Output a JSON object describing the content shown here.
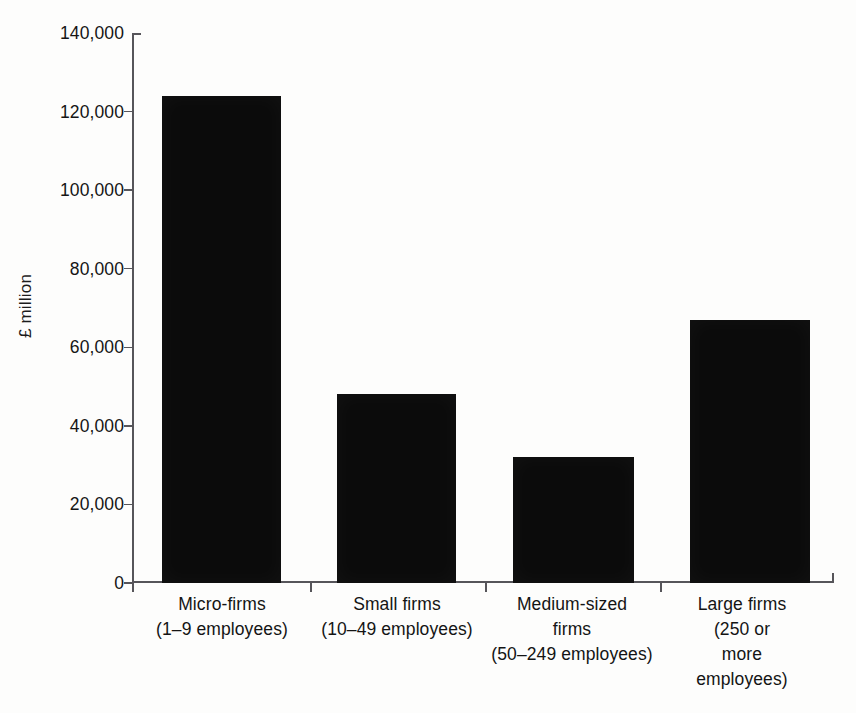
{
  "chart_data": {
    "type": "bar",
    "title": "",
    "xlabel": "",
    "ylabel": "£ million",
    "categories": [
      "Micro-firms (1–9 employees)",
      "Small firms (10–49 employees)",
      "Medium-sized firms (50–249 employees)",
      "Large firms (250 or more employees)"
    ],
    "category_lines": [
      [
        "Micro-firms",
        "(1–9 employees)"
      ],
      [
        "Small firms",
        "(10–49 employees)"
      ],
      [
        "Medium-sized",
        "firms",
        "(50–249 employees)"
      ],
      [
        "Large firms",
        "(250 or",
        "more",
        "employees)"
      ]
    ],
    "values": [
      124000,
      48000,
      32000,
      67000
    ],
    "ylim": [
      0,
      140000
    ],
    "ytick_values": [
      0,
      20000,
      40000,
      60000,
      80000,
      100000,
      120000,
      140000
    ],
    "ytick_labels": [
      "0",
      "20,000",
      "40,000",
      "60,000",
      "80,000",
      "100,000",
      "120,000",
      "140,000"
    ],
    "grid": false,
    "legend": false,
    "bar_color": "#0b0b0b",
    "axis_color": "#56555a",
    "background_color": "#fdfdfc"
  },
  "axis": {
    "y_title": "£ million"
  }
}
